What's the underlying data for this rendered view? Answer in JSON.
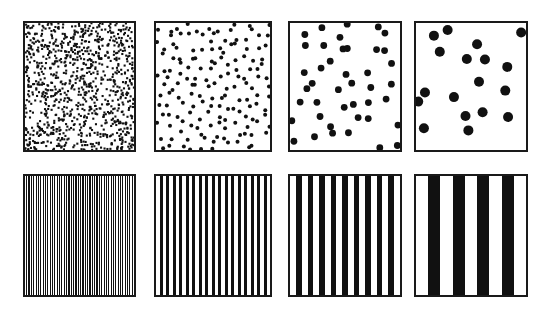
{
  "figure": {
    "canvas": {
      "width": 556,
      "height": 316
    },
    "background_color": "#ffffff",
    "ink_color": "#111111",
    "border_color": "#1a1a1a",
    "border_width": 2,
    "rows": 2,
    "columns": 4
  },
  "chart_data": {
    "type": "heatmap",
    "xlabel": "",
    "ylabel": "",
    "grid": false,
    "legend": "none",
    "categories": [
      "panel 1",
      "panel 2",
      "panel 3",
      "panel 4"
    ],
    "series": [
      {
        "name": "dot density (dots per swatch)",
        "values": [
          1000,
          150,
          40,
          18
        ]
      },
      {
        "name": "dot radius (px)",
        "values": [
          1.1,
          2.0,
          3.4,
          5.0
        ]
      },
      {
        "name": "stripe count (dark bars per swatch)",
        "values": [
          46,
          17,
          9,
          4
        ]
      },
      {
        "name": "stripe width (px)",
        "values": [
          1.2,
          3.0,
          5.5,
          12.0
        ]
      }
    ]
  },
  "panels": [
    {
      "id": "dots-fine",
      "name": "Fine stipple dots",
      "row": 1,
      "column": 1,
      "kind": "dots",
      "x": 23,
      "y": 21,
      "width": 113,
      "height": 131,
      "dot_count": 1000,
      "dot_radius": 1.1,
      "seed": 11
    },
    {
      "id": "dots-small",
      "name": "Small dots",
      "row": 1,
      "column": 2,
      "kind": "dots",
      "x": 154,
      "y": 21,
      "width": 118,
      "height": 131,
      "dot_count": 155,
      "dot_radius": 2.0,
      "seed": 23
    },
    {
      "id": "dots-medium",
      "name": "Medium dots",
      "row": 1,
      "column": 3,
      "kind": "dots",
      "x": 288,
      "y": 21,
      "width": 114,
      "height": 131,
      "dot_count": 42,
      "dot_radius": 3.4,
      "seed": 37
    },
    {
      "id": "dots-large",
      "name": "Large dots",
      "row": 1,
      "column": 4,
      "kind": "dots",
      "x": 414,
      "y": 21,
      "width": 114,
      "height": 131,
      "dot_count": 18,
      "dot_radius": 5.0,
      "seed": 53
    },
    {
      "id": "stripes-fine",
      "name": "Fine vertical stripes",
      "row": 2,
      "column": 1,
      "kind": "stripes",
      "x": 23,
      "y": 174,
      "width": 113,
      "height": 123,
      "stripe_count": 46,
      "stripe_width": 1.2
    },
    {
      "id": "stripes-narrow",
      "name": "Narrow vertical stripes",
      "row": 2,
      "column": 2,
      "kind": "stripes",
      "x": 154,
      "y": 174,
      "width": 118,
      "height": 123,
      "stripe_count": 17,
      "stripe_width": 3.0
    },
    {
      "id": "stripes-medium",
      "name": "Medium vertical stripes",
      "row": 2,
      "column": 3,
      "kind": "stripes",
      "x": 288,
      "y": 174,
      "width": 114,
      "height": 123,
      "stripe_count": 9,
      "stripe_width": 5.5
    },
    {
      "id": "stripes-wide",
      "name": "Wide vertical stripes",
      "row": 2,
      "column": 4,
      "kind": "stripes",
      "x": 414,
      "y": 174,
      "width": 114,
      "height": 123,
      "stripe_count": 4,
      "stripe_width": 12.0
    }
  ]
}
